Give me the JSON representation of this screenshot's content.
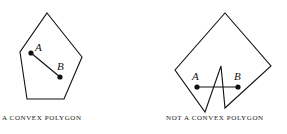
{
  "figures": [
    {
      "caption": "A CONVEX POLYGON",
      "point_a_label": "A",
      "point_b_label": "B"
    },
    {
      "caption": "NOT A CONVEX POLYGON",
      "point_a_label": "A",
      "point_b_label": "B"
    }
  ],
  "colors": {
    "stroke": "#111111",
    "background": "#ffffff"
  }
}
